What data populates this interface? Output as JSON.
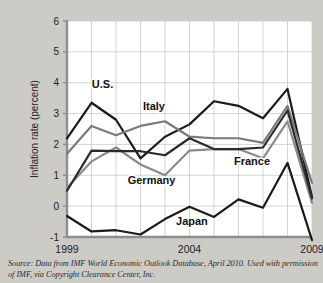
{
  "figure": {
    "source_note": "Source: Data from IMF World Economic Outlook Database, April 2010. Used with permission of IMF, via Copyright Clearance Center, Inc.",
    "background_color": "#cdcbc6",
    "plot_background_color": "#ffffff"
  },
  "chart_data": {
    "type": "line",
    "title": "",
    "xlabel": "",
    "ylabel": "Inflation rate (percent)",
    "x": [
      1999,
      2000,
      2001,
      2002,
      2003,
      2004,
      2005,
      2006,
      2007,
      2008,
      2009
    ],
    "xlim": [
      1999,
      2009
    ],
    "ylim": [
      -1,
      6
    ],
    "xticks": [
      1999,
      2000,
      2001,
      2002,
      2003,
      2004,
      2005,
      2006,
      2007,
      2008,
      2009
    ],
    "xtick_labels": [
      "1999",
      "",
      "",
      "",
      "",
      "2004",
      "",
      "",
      "",
      "",
      "2009"
    ],
    "yticks": [
      -1,
      0,
      1,
      2,
      3,
      4,
      5,
      6
    ],
    "ytick_labels": [
      "-1",
      "0",
      "1",
      "2",
      "3",
      "4",
      "5",
      "6"
    ],
    "grid": true,
    "legend_position": "inline-annotations",
    "series": [
      {
        "name": "U.S.",
        "color": "#1a1a1a",
        "width": 2.2,
        "label_x": 2000.45,
        "label_y": 3.82,
        "values": [
          2.2,
          3.35,
          2.8,
          1.55,
          2.25,
          2.65,
          3.4,
          3.25,
          2.85,
          3.8,
          0.3
        ]
      },
      {
        "name": "Italy",
        "color": "#7a7a7a",
        "width": 2.2,
        "label_x": 2002.55,
        "label_y": 3.12,
        "values": [
          1.7,
          2.6,
          2.3,
          2.6,
          2.75,
          2.25,
          2.2,
          2.2,
          2.05,
          3.25,
          0.75
        ]
      },
      {
        "name": "Germany",
        "color": "#8a8a8a",
        "width": 2.2,
        "label_x": 2002.45,
        "label_y": 0.72,
        "values": [
          0.6,
          1.45,
          1.9,
          1.35,
          1.0,
          1.8,
          1.85,
          1.85,
          1.55,
          2.75,
          0.1
        ]
      },
      {
        "name": "France",
        "color": "#2a2a2a",
        "width": 2.2,
        "label_x": 2006.55,
        "label_y": 1.32,
        "values": [
          0.5,
          1.8,
          1.78,
          1.78,
          1.65,
          2.2,
          1.85,
          1.85,
          1.9,
          3.1,
          0.25
        ]
      },
      {
        "name": "Japan",
        "color": "#1a1a1a",
        "width": 2.2,
        "label_x": 2004.1,
        "label_y": -0.62,
        "values": [
          -0.32,
          -0.82,
          -0.78,
          -0.92,
          -0.42,
          -0.02,
          -0.35,
          0.22,
          -0.05,
          1.4,
          -1.1
        ]
      }
    ]
  }
}
